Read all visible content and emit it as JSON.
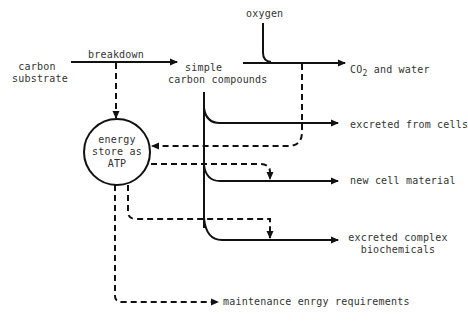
{
  "colors": {
    "line": "#111111",
    "text": "#333333",
    "background": "#ffffff"
  },
  "nodes": {
    "carbon_substrate": {
      "line1": "carbon",
      "line2": "substrate"
    },
    "breakdown": "breakdown",
    "simple_carbon": {
      "line1": "simple",
      "line2": "carbon compounds"
    },
    "oxygen": "oxygen",
    "co2_water": {
      "prefix": "CO",
      "sub": "2",
      "suffix": " and water"
    },
    "energy_store": {
      "line1": "energy",
      "line2": "store as",
      "line3": "ATP"
    },
    "excreted_from_cells": "excreted from cells",
    "new_cell_material": "new cell material",
    "excreted_complex": {
      "line1": "excreted complex",
      "line2": "biochemicals"
    },
    "maintenance": "maintenance enrgy requirements"
  },
  "legend": {
    "solid_line": "carbon flow",
    "dashed_line": "energy flow"
  }
}
